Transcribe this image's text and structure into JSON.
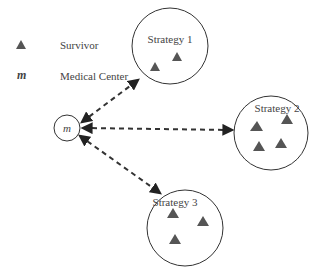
{
  "legend": {
    "items": [
      {
        "symbol": "triangle",
        "label": "Survivor"
      },
      {
        "symbol": "m",
        "label": "Medical Center"
      }
    ]
  },
  "medical_center": {
    "symbol": "m"
  },
  "strategies": [
    {
      "label": "Strategy 1",
      "survivors": 2
    },
    {
      "label": "Strategy 2",
      "survivors": 4
    },
    {
      "label": "Strategy 3",
      "survivors": 3
    }
  ],
  "colors": {
    "triangle": "#555555",
    "stroke": "#333333",
    "text": "#444444"
  }
}
